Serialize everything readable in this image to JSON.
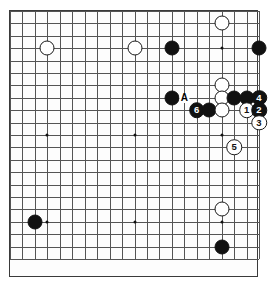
{
  "diagram": {
    "kind": "go-board-diagram",
    "board_size": 21,
    "colors": {
      "black_stone": "#111111",
      "white_stone": "#ffffff",
      "stone_outline": "#1a1a1a",
      "grid": "#555555",
      "border": "#3a3a3a",
      "background": "#ffffff"
    },
    "geometry": {
      "origin_x": 9,
      "origin_y": 10,
      "spacing_x": 12.45,
      "spacing_y": 12.4,
      "lines": 21,
      "stone_diameter": 15,
      "numbered_stone_diameter": 15.5
    },
    "star_points": [
      {
        "col": 3,
        "row": 3
      },
      {
        "col": 10,
        "row": 3
      },
      {
        "col": 17,
        "row": 3
      },
      {
        "col": 3,
        "row": 10
      },
      {
        "col": 10,
        "row": 10
      },
      {
        "col": 17,
        "row": 10
      },
      {
        "col": 3,
        "row": 17
      },
      {
        "col": 10,
        "row": 17
      },
      {
        "col": 17,
        "row": 17
      }
    ],
    "stones": [
      {
        "id": "w-top-left",
        "color": "white",
        "col": 3,
        "row": 3,
        "label": ""
      },
      {
        "id": "w-top-mid",
        "color": "white",
        "col": 10,
        "row": 3,
        "label": ""
      },
      {
        "id": "b-top-mid-right",
        "color": "black",
        "col": 13,
        "row": 3,
        "label": ""
      },
      {
        "id": "w-top-right-high",
        "color": "white",
        "col": 17,
        "row": 1,
        "label": ""
      },
      {
        "id": "b-top-right",
        "color": "black",
        "col": 20,
        "row": 3,
        "label": ""
      },
      {
        "id": "w-right-upper",
        "color": "white",
        "col": 17,
        "row": 6,
        "label": ""
      },
      {
        "id": "w-right-mid",
        "color": "white",
        "col": 17,
        "row": 7,
        "label": ""
      },
      {
        "id": "b-side-left",
        "color": "black",
        "col": 13,
        "row": 7,
        "label": ""
      },
      {
        "id": "b-right-row7-a",
        "color": "black",
        "col": 18,
        "row": 7,
        "label": ""
      },
      {
        "id": "b-right-row7-b",
        "color": "black",
        "col": 19,
        "row": 7,
        "label": ""
      },
      {
        "id": "b-move-4",
        "color": "black",
        "col": 20,
        "row": 7,
        "label": "4"
      },
      {
        "id": "b-move-6",
        "color": "black",
        "col": 15,
        "row": 8,
        "label": "6"
      },
      {
        "id": "b-row8",
        "color": "black",
        "col": 16,
        "row": 8,
        "label": ""
      },
      {
        "id": "w-row8",
        "color": "white",
        "col": 17,
        "row": 8,
        "label": ""
      },
      {
        "id": "w-move-1",
        "color": "white",
        "col": 19,
        "row": 8,
        "label": "1"
      },
      {
        "id": "b-move-2",
        "color": "black",
        "col": 20,
        "row": 8,
        "label": "2"
      },
      {
        "id": "w-move-3",
        "color": "white",
        "col": 20,
        "row": 9,
        "label": "3"
      },
      {
        "id": "w-move-5",
        "color": "white",
        "col": 18,
        "row": 11,
        "label": "5"
      },
      {
        "id": "b-bottom-left",
        "color": "black",
        "col": 2,
        "row": 17,
        "label": ""
      },
      {
        "id": "w-bottom-right",
        "color": "white",
        "col": 17,
        "row": 16,
        "label": ""
      },
      {
        "id": "b-bottom-right",
        "color": "black",
        "col": 17,
        "row": 19,
        "label": ""
      }
    ],
    "labels": [
      {
        "id": "label-a",
        "text": "A",
        "col": 14,
        "row": 7
      }
    ]
  }
}
